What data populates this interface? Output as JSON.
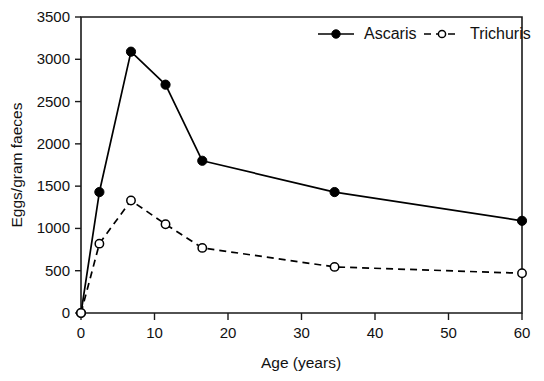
{
  "chart_data": {
    "type": "line",
    "title": "",
    "xlabel": "Age (years)",
    "ylabel": "Eggs/gram faeces",
    "xlim": [
      0,
      60
    ],
    "ylim": [
      0,
      3500
    ],
    "xticks": [
      0,
      10,
      20,
      30,
      40,
      50,
      60
    ],
    "yticks": [
      0,
      500,
      1000,
      1500,
      2000,
      2500,
      3000,
      3500
    ],
    "xtick_labels": [
      "0",
      "10",
      "20",
      "30",
      "40",
      "50",
      "60"
    ],
    "ytick_labels": [
      "0",
      "500",
      "1000",
      "1500",
      "2000",
      "2500",
      "3000",
      "3500"
    ],
    "grid": false,
    "legend_position": "top-right-inside",
    "series": [
      {
        "name": "Ascaris",
        "line_style": "solid",
        "marker": "filled-circle",
        "color": "#000000",
        "x": [
          0,
          2.5,
          6.8,
          11.5,
          16.5,
          34.5,
          60
        ],
        "values": [
          0,
          1430,
          3090,
          2700,
          1800,
          1430,
          1090
        ]
      },
      {
        "name": "Trichuris",
        "line_style": "dashed",
        "marker": "open-circle",
        "color": "#000000",
        "x": [
          0,
          2.5,
          6.8,
          11.5,
          16.5,
          34.5,
          60
        ],
        "values": [
          0,
          820,
          1330,
          1050,
          770,
          545,
          470
        ]
      }
    ]
  },
  "legend": {
    "entries": [
      {
        "label": "Ascaris",
        "style": "solid-filled"
      },
      {
        "label": "Trichuris",
        "style": "dashed-open"
      }
    ]
  },
  "axes": {
    "x_title": "Age (years)",
    "y_title": "Eggs/gram faeces"
  }
}
